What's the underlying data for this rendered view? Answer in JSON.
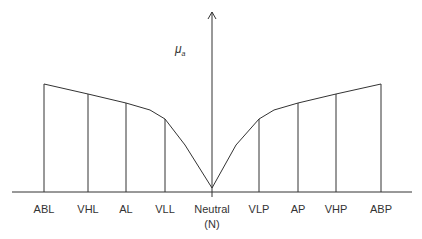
{
  "diagram": {
    "y_axis_label": "μ",
    "y_axis_subscript": "a",
    "line_color": "#333333",
    "categories": [
      {
        "label": "ABL",
        "x": 44,
        "top_y": 84
      },
      {
        "label": "VHL",
        "x": 88,
        "top_y": 94
      },
      {
        "label": "AL",
        "x": 126,
        "top_y": 103
      },
      {
        "label": "VLL",
        "x": 165,
        "top_y": 119
      },
      {
        "label": "Neutral",
        "sublabel": "(N)",
        "x": 212,
        "top_y": 188
      },
      {
        "label": "VLP",
        "x": 259,
        "top_y": 119
      },
      {
        "label": "AP",
        "x": 298,
        "top_y": 103
      },
      {
        "label": "VHP",
        "x": 336,
        "top_y": 94
      },
      {
        "label": "ABP",
        "x": 381,
        "top_y": 84
      }
    ]
  }
}
